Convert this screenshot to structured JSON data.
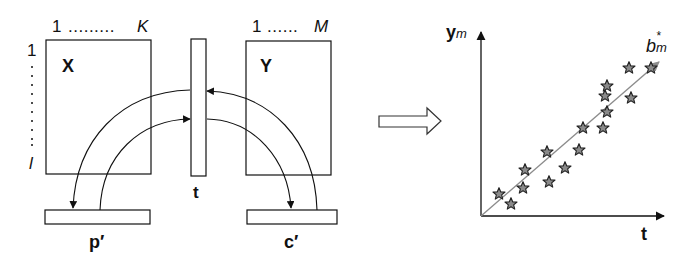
{
  "left_diagram": {
    "matrix_x": {
      "label": "X",
      "col_start": "1",
      "col_dots": ".........",
      "col_end": "K",
      "row_start": "1",
      "row_end": "l"
    },
    "score_vector": {
      "label": "t"
    },
    "matrix_y": {
      "label": "Y",
      "col_start": "1",
      "col_dots": "......",
      "col_end": "M"
    },
    "x_weights": {
      "label": "p′"
    },
    "y_weights": {
      "label": "c′"
    }
  },
  "transition_arrow": {
    "icon": "block-right-arrow-icon"
  },
  "right_plot": {
    "y_axis_label_main": "y",
    "y_axis_label_sub": "m",
    "x_axis_label": "t",
    "line_label_main": "b",
    "line_label_sub": "m",
    "line_label_sup": "*",
    "marker": "star-icon",
    "colors": {
      "marker_fill": "#8a8a8a",
      "marker_stroke": "#222222",
      "line": "#8c8c8c",
      "axes": "#111111"
    }
  },
  "chart_data": {
    "type": "scatter",
    "title": "",
    "xlabel": "t",
    "ylabel": "y_m",
    "annotations": [
      "b*_m (regression line)"
    ],
    "grid": false,
    "x": [
      0.09,
      0.15,
      0.21,
      0.22,
      0.34,
      0.33,
      0.42,
      0.49,
      0.51,
      0.61,
      0.63,
      0.62,
      0.63,
      0.75,
      0.74,
      0.85
    ],
    "y": [
      0.11,
      0.06,
      0.14,
      0.23,
      0.17,
      0.32,
      0.24,
      0.33,
      0.44,
      0.44,
      0.52,
      0.6,
      0.65,
      0.59,
      0.74,
      0.74
    ]
  }
}
